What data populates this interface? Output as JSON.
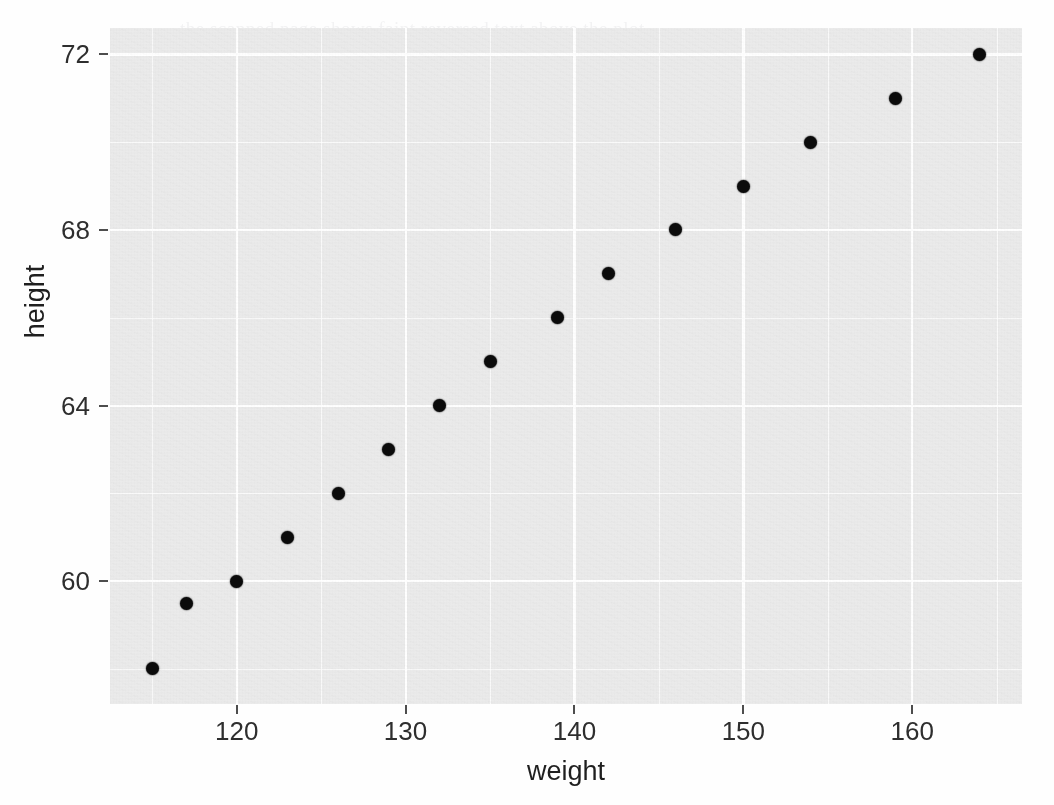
{
  "figure": {
    "background_color": "#fefefe",
    "panel_color": "#ebebeb",
    "grid_color": "#ffffff",
    "point_color": "#0b0b0b"
  },
  "axes": {
    "x_title": "weight",
    "y_title": "height",
    "x_ticks": [
      "120",
      "130",
      "140",
      "150",
      "160"
    ],
    "y_ticks": [
      "60",
      "64",
      "68",
      "72"
    ]
  },
  "ghost_text": {
    "note": "faint scanner bleed-through text, illegible",
    "lines": [
      "the scanned page shows faint reversed text above the plot",
      "bleed-through from the opposite side",
      "second smeared line of reversed copy text across the figure",
      "fourth line"
    ]
  },
  "chart_data": {
    "type": "scatter",
    "title": "",
    "xlabel": "weight",
    "ylabel": "height",
    "xlim": [
      112.5,
      166.5
    ],
    "ylim": [
      57.2,
      72.6
    ],
    "xticks": [
      120,
      130,
      140,
      150,
      160
    ],
    "yticks": [
      60,
      64,
      68,
      72
    ],
    "x_minor_ticks": [
      115,
      125,
      135,
      145,
      155,
      165
    ],
    "y_minor_ticks": [
      58,
      62,
      66,
      70
    ],
    "grid": true,
    "legend": "none",
    "series": [
      {
        "name": "observations",
        "marker": "filled-circle",
        "color": "#0b0b0b",
        "x": [
          115,
          117,
          120,
          123,
          126,
          129,
          132,
          135,
          139,
          142,
          146,
          150,
          154,
          159,
          164
        ],
        "y": [
          58,
          59.5,
          60,
          61,
          62,
          63,
          64,
          65,
          66,
          67,
          68,
          69,
          70,
          71,
          72
        ]
      }
    ]
  }
}
